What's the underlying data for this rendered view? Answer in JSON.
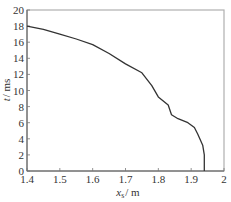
{
  "chart_data": {
    "type": "line",
    "title": "",
    "xlabel": "x_s / m",
    "ylabel": "t / ms",
    "xlim": [
      1.4,
      2.0
    ],
    "ylim": [
      0,
      20
    ],
    "grid": false,
    "legend": null,
    "x_ticks": [
      "1.4",
      "1.5",
      "1.6",
      "1.7",
      "1.8",
      "1.9",
      "2"
    ],
    "y_ticks": [
      "0",
      "2",
      "4",
      "6",
      "8",
      "10",
      "12",
      "14",
      "16",
      "18",
      "20"
    ],
    "series": [
      {
        "name": "t vs x_s",
        "color": "#333333",
        "x": [
          1.4,
          1.45,
          1.5,
          1.55,
          1.6,
          1.65,
          1.7,
          1.75,
          1.78,
          1.8,
          1.83,
          1.84,
          1.86,
          1.89,
          1.91,
          1.92,
          1.935,
          1.94,
          1.94
        ],
        "y": [
          18.0,
          17.6,
          17.0,
          16.4,
          15.7,
          14.6,
          13.3,
          12.2,
          10.6,
          9.2,
          8.2,
          7.0,
          6.5,
          6.0,
          5.4,
          4.6,
          3.2,
          2.0,
          0.0
        ]
      }
    ]
  },
  "labels": {
    "x_main": "x",
    "x_sub": "s",
    "x_unit": "/ m",
    "y_main": "t",
    "y_unit": "/ ms"
  }
}
